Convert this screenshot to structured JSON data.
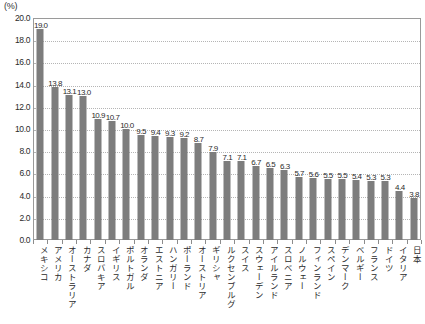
{
  "unit_label": "(%)",
  "chart_data": {
    "type": "bar",
    "title": "",
    "xlabel": "",
    "ylabel": "(%)",
    "ylim": [
      0.0,
      20.0
    ],
    "ytick_step": 2.0,
    "grid": true,
    "legend": "none",
    "bar_color": "#7d7d7d",
    "plot_border_color": "#9a9a9a",
    "gridline_color": "#b5b5b5",
    "ytick_labels": [
      "20.0",
      "18.0",
      "16.0",
      "14.0",
      "12.0",
      "10.0",
      "8.0",
      "6.0",
      "4.0",
      "2.0",
      "0.0"
    ],
    "ytick_values": [
      20.0,
      18.0,
      16.0,
      14.0,
      12.0,
      10.0,
      8.0,
      6.0,
      4.0,
      2.0,
      0.0
    ],
    "categories": [
      "メキシコ",
      "アメリカ",
      "オーストラリア",
      "カナダ",
      "スロバキア",
      "イギリス",
      "ポルトガル",
      "オランダ",
      "エストニア",
      "ハンガリー",
      "ポーランド",
      "オーストリア",
      "ギリシャ",
      "ルクセンブルグ",
      "スイス",
      "スウェーデン",
      "アイルランド",
      "スロベニア",
      "ノルウェー",
      "フィンランド",
      "スペイン",
      "デンマーク",
      "ベルギー",
      "フランス",
      "ドイツ",
      "イタリア",
      "日本"
    ],
    "values": [
      19.0,
      13.8,
      13.1,
      13.0,
      10.9,
      10.7,
      10.0,
      9.5,
      9.4,
      9.3,
      9.2,
      8.7,
      7.9,
      7.1,
      7.1,
      6.7,
      6.5,
      6.3,
      5.7,
      5.6,
      5.5,
      5.5,
      5.4,
      5.3,
      5.3,
      4.4,
      3.8
    ],
    "value_labels": [
      "19.0",
      "13.8",
      "13.1",
      "13.0",
      "10.9",
      "10.7",
      "10.0",
      "9.5",
      "9.4",
      "9.3",
      "9.2",
      "8.7",
      "7.9",
      "7.1",
      "7.1",
      "6.7",
      "6.5",
      "6.3",
      "5.7",
      "5.6",
      "5.5",
      "5.5",
      "5.4",
      "5.3",
      "5.3",
      "4.4",
      "3.8"
    ]
  }
}
